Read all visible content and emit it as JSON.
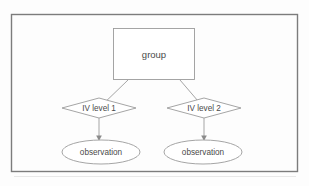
{
  "diagram": {
    "frame": {
      "name": "outer-border",
      "color": "#7c7c7c"
    },
    "background_color": "#fdfdfd",
    "shape_stroke_color": "#9b9b9b",
    "text_color": "#4a4a4a",
    "nodes": [
      {
        "id": "group",
        "shape": "rectangle",
        "label": "group"
      },
      {
        "id": "iv-level-1",
        "shape": "diamond",
        "label": "IV level 1"
      },
      {
        "id": "iv-level-2",
        "shape": "diamond",
        "label": "IV level 2"
      },
      {
        "id": "observation-1",
        "shape": "ellipse",
        "label": "observation"
      },
      {
        "id": "observation-2",
        "shape": "ellipse",
        "label": "observation"
      }
    ],
    "edges": [
      {
        "from": "group",
        "to": "iv-level-1",
        "arrow": false
      },
      {
        "from": "group",
        "to": "iv-level-2",
        "arrow": false
      },
      {
        "from": "iv-level-1",
        "to": "observation-1",
        "arrow": true
      },
      {
        "from": "iv-level-2",
        "to": "observation-2",
        "arrow": true
      }
    ]
  }
}
